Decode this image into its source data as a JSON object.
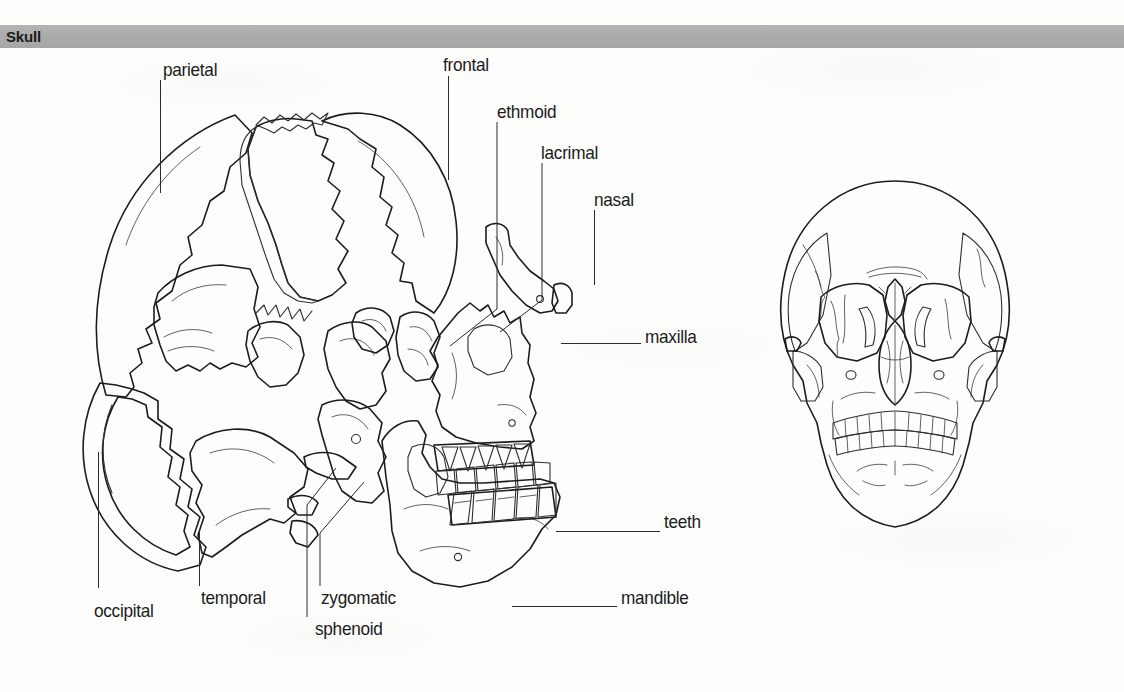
{
  "page": {
    "width": 1124,
    "height": 692,
    "background_color": "#fdfdfc"
  },
  "header": {
    "title": "Skull",
    "band_color": "#aaaaaa",
    "text_color": "#1a1a1a"
  },
  "figures": [
    {
      "id": "exploded-lateral-skull",
      "name": "exploded-lateral-skull-illustration",
      "view": "lateral exploded",
      "description": "Disarticulated lateral view of the human skull with individual bones separated"
    },
    {
      "id": "frontal-skull",
      "name": "frontal-skull-illustration",
      "view": "anterior",
      "description": "Articulated anterior view of the human skull"
    }
  ],
  "labels": [
    {
      "id": "parietal",
      "text": "parietal",
      "x": 163,
      "y": 60,
      "align": "left"
    },
    {
      "id": "frontal",
      "text": "frontal",
      "x": 443,
      "y": 55,
      "align": "left"
    },
    {
      "id": "ethmoid",
      "text": "ethmoid",
      "x": 497,
      "y": 102,
      "align": "left"
    },
    {
      "id": "lacrimal",
      "text": "lacrimal",
      "x": 541,
      "y": 143,
      "align": "left"
    },
    {
      "id": "nasal",
      "text": "nasal",
      "x": 594,
      "y": 190,
      "align": "left"
    },
    {
      "id": "maxilla",
      "text": "maxilla",
      "x": 645,
      "y": 327,
      "align": "left"
    },
    {
      "id": "teeth",
      "text": "teeth",
      "x": 664,
      "y": 512,
      "align": "left"
    },
    {
      "id": "mandible",
      "text": "mandible",
      "x": 621,
      "y": 588,
      "align": "left"
    },
    {
      "id": "occipital",
      "text": "occipital",
      "x": 94,
      "y": 601,
      "align": "left"
    },
    {
      "id": "temporal",
      "text": "temporal",
      "x": 201,
      "y": 588,
      "align": "left"
    },
    {
      "id": "zygomatic",
      "text": "zygomatic",
      "x": 321,
      "y": 588,
      "align": "left"
    },
    {
      "id": "sphenoid",
      "text": "sphenoid",
      "x": 315,
      "y": 619,
      "align": "left"
    }
  ],
  "colors": {
    "outline": "#1c1c1c",
    "bone_light": "#ececea",
    "bone_mid": "#c9c9c6",
    "bone_shade": "#a8a8a5",
    "bone_dark": "#8d8d8a",
    "cavity_dark": "#4c4c4c",
    "cavity_darkest": "#3a3a3a",
    "tooth": "#fbfbfa",
    "label_text": "#1b1b1b",
    "leader_line": "#2a2a2a"
  }
}
